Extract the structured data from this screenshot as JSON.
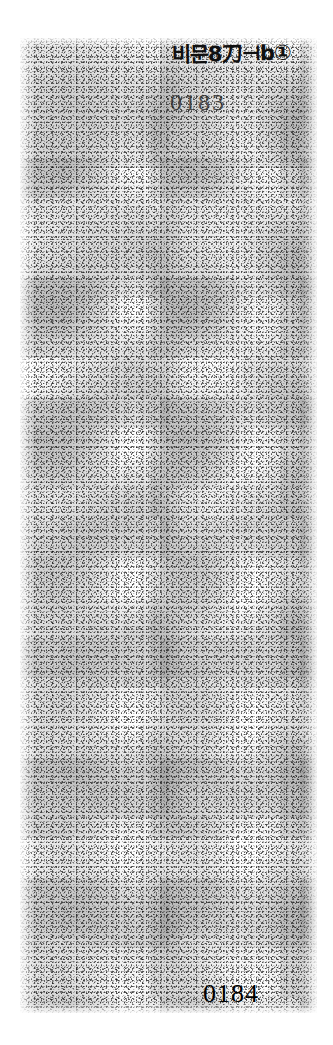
{
  "document": {
    "kind": "scanned-page",
    "background_color": "#ffffff",
    "ink_color": "#000000",
    "condition": "heavily speckled / degraded photocopy scan"
  },
  "scan": {
    "region_label": "scanned paper area",
    "noise_description": "uniform black speckle grain covering the full page body, no legible body text"
  },
  "annotations": {
    "handwritten_note": "비문8刀⊣b①",
    "handwritten_note_position": "top-right"
  },
  "stamps": {
    "upper_number": "0183"
  },
  "footer": {
    "page_number": "0184"
  }
}
